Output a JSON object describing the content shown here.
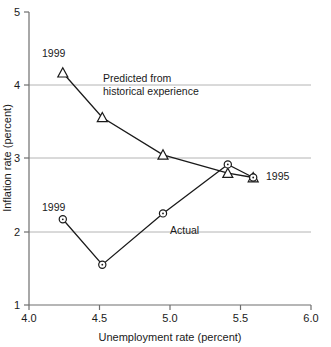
{
  "chart_data": {
    "type": "line",
    "title": "",
    "xlabel": "Unemployment rate (percent)",
    "ylabel": "Inflation rate (percent)",
    "xlim": [
      4.0,
      6.0
    ],
    "ylim": [
      1,
      5
    ],
    "xticks": [
      "4.0",
      "4.5",
      "5.0",
      "5.5",
      "6.0"
    ],
    "xtick_values": [
      4.0,
      4.5,
      5.0,
      5.5,
      6.0
    ],
    "yticks": [
      "1",
      "2",
      "3",
      "4",
      "5"
    ],
    "ytick_values": [
      1,
      2,
      3,
      4,
      5
    ],
    "grid": "horizontal gridlines at y = 2, 3, 4",
    "legend_position": "inline annotations",
    "series": [
      {
        "name": "Predicted from historical experience",
        "marker": "triangle",
        "points": [
          {
            "x": 4.24,
            "y": 4.17,
            "label": "1999"
          },
          {
            "x": 4.52,
            "y": 3.56,
            "label": ""
          },
          {
            "x": 4.95,
            "y": 3.05,
            "label": ""
          },
          {
            "x": 5.41,
            "y": 2.8,
            "label": ""
          },
          {
            "x": 5.59,
            "y": 2.74,
            "label": "1995"
          }
        ]
      },
      {
        "name": "Actual",
        "marker": "circle",
        "points": [
          {
            "x": 4.24,
            "y": 2.17,
            "label": "1999"
          },
          {
            "x": 4.52,
            "y": 1.55,
            "label": ""
          },
          {
            "x": 4.95,
            "y": 2.25,
            "label": ""
          },
          {
            "x": 5.41,
            "y": 2.92,
            "label": ""
          },
          {
            "x": 5.59,
            "y": 2.74,
            "label": "1995"
          }
        ]
      }
    ],
    "annotations": [
      {
        "name": "predicted-annotation-line1",
        "text": "Predicted from"
      },
      {
        "name": "predicted-annotation-line2",
        "text": "historical experience"
      },
      {
        "name": "actual-annotation",
        "text": "Actual"
      },
      {
        "name": "predicted-start-year",
        "text": "1999"
      },
      {
        "name": "actual-start-year",
        "text": "1999"
      },
      {
        "name": "end-year",
        "text": "1995"
      }
    ],
    "colors": {
      "line": "#1a1a1a",
      "grid": "#b4b4b4",
      "axis": "#6e6e6e",
      "text": "#1a1a1a",
      "background": "#ffffff"
    }
  }
}
